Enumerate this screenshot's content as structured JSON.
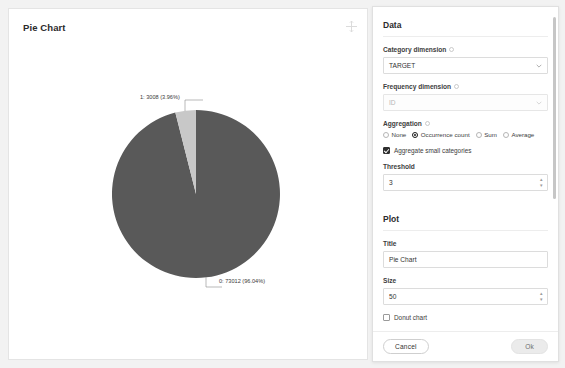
{
  "chart_panel": {
    "title": "Pie Chart",
    "toolbar_icon": "move-crosshair-icon"
  },
  "chart_data": {
    "type": "pie",
    "title": "Pie Chart",
    "categories": [
      "0",
      "1"
    ],
    "values": [
      73012,
      3008
    ],
    "percents": [
      96.04,
      3.96
    ],
    "labels": [
      "0: 73012 (96.04%)",
      "1: 3008 (3.96%)"
    ],
    "colors": [
      "#595959",
      "#c8c8c8"
    ],
    "donut": false,
    "legend": "none",
    "label_placement": "outside-with-leader-lines",
    "start_angle_deg": 90,
    "direction": "counterclockwise"
  },
  "settings": {
    "data_section": {
      "heading": "Data",
      "category_dimension": {
        "label": "Category dimension",
        "value": "TARGET",
        "help_icon": "help-circle-icon",
        "chevron_icon": "chevron-down-icon"
      },
      "frequency_dimension": {
        "label": "Frequency dimension",
        "value": "ID",
        "disabled": true,
        "help_icon": "help-circle-icon",
        "chevron_icon": "chevron-down-icon"
      },
      "aggregation": {
        "label": "Aggregation",
        "help_icon": "help-circle-icon",
        "options": [
          {
            "label": "None",
            "selected": false
          },
          {
            "label": "Occurrence count",
            "selected": true
          },
          {
            "label": "Sum",
            "selected": false
          },
          {
            "label": "Average",
            "selected": false
          }
        ]
      },
      "aggregate_small": {
        "label": "Aggregate small categories",
        "checked": true
      },
      "threshold": {
        "label": "Threshold",
        "value": "3",
        "stepper_up_icon": "chevron-up-icon",
        "stepper_down_icon": "chevron-down-icon"
      }
    },
    "plot_section": {
      "heading": "Plot",
      "title_field": {
        "label": "Title",
        "value": "Pie Chart"
      },
      "size_field": {
        "label": "Size",
        "value": "50",
        "stepper_up_icon": "chevron-up-icon",
        "stepper_down_icon": "chevron-down-icon"
      },
      "donut_chart": {
        "label": "Donut chart",
        "checked": false
      }
    },
    "footer": {
      "cancel_label": "Cancel",
      "ok_label": "Ok"
    },
    "scrollbar": {
      "present": true
    }
  }
}
